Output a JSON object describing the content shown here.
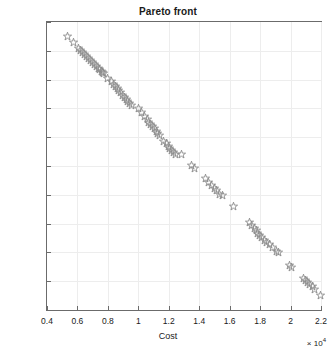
{
  "chart_data": {
    "type": "scatter",
    "title": "Pareto front",
    "xlabel": "Cost",
    "ylabel": "Quality",
    "x_exponent": "×10⁴",
    "x_exponent_mantissa": "× 10",
    "x_exponent_power": "4",
    "xlim": [
      0.4,
      2.2
    ],
    "ylim": [
      0,
      20
    ],
    "xticks": [
      0.4,
      0.6,
      0.8,
      1.0,
      1.2,
      1.4,
      1.6,
      1.8,
      2.0,
      2.2
    ],
    "xtick_labels": [
      "0.4",
      "0.6",
      "0.8",
      "1",
      "1.2",
      "1.4",
      "1.6",
      "1.8",
      "2",
      "2.2"
    ],
    "yticks": [
      0,
      2,
      4,
      6,
      8,
      10,
      12,
      14,
      16,
      18,
      20
    ],
    "ytick_labels": [
      "0",
      "2",
      "4",
      "6",
      "8",
      "10",
      "12",
      "14",
      "16",
      "18",
      "20"
    ],
    "grid": true,
    "legend": null,
    "marker": "pentagram-star-open",
    "marker_color": "#8a8a8a",
    "axis_color": "#6b6b6b",
    "grid_color": "#ededed",
    "title_color": "#1a1a1a",
    "series": [
      {
        "name": "Pareto front",
        "points": [
          [
            0.533,
            19.0
          ],
          [
            0.575,
            18.6
          ],
          [
            0.605,
            18.15
          ],
          [
            0.62,
            18.05
          ],
          [
            0.635,
            17.9
          ],
          [
            0.648,
            17.75
          ],
          [
            0.66,
            17.62
          ],
          [
            0.673,
            17.48
          ],
          [
            0.686,
            17.35
          ],
          [
            0.7,
            17.2
          ],
          [
            0.713,
            17.05
          ],
          [
            0.724,
            16.93
          ],
          [
            0.736,
            16.8
          ],
          [
            0.748,
            16.68
          ],
          [
            0.757,
            16.58
          ],
          [
            0.765,
            16.5
          ],
          [
            0.772,
            16.45
          ],
          [
            0.8,
            16.1
          ],
          [
            0.822,
            15.85
          ],
          [
            0.836,
            15.68
          ],
          [
            0.848,
            15.52
          ],
          [
            0.86,
            15.38
          ],
          [
            0.872,
            15.22
          ],
          [
            0.884,
            15.08
          ],
          [
            0.896,
            14.92
          ],
          [
            0.908,
            14.78
          ],
          [
            0.92,
            14.62
          ],
          [
            0.932,
            14.48
          ],
          [
            0.944,
            14.35
          ],
          [
            0.958,
            14.18
          ],
          [
            0.998,
            13.98
          ],
          [
            1.022,
            13.7
          ],
          [
            1.042,
            13.42
          ],
          [
            1.058,
            13.2
          ],
          [
            1.07,
            13.02
          ],
          [
            1.082,
            12.88
          ],
          [
            1.094,
            12.72
          ],
          [
            1.106,
            12.58
          ],
          [
            1.118,
            12.42
          ],
          [
            1.128,
            12.28
          ],
          [
            1.14,
            12.12
          ],
          [
            1.168,
            11.72
          ],
          [
            1.182,
            11.58
          ],
          [
            1.196,
            11.38
          ],
          [
            1.208,
            11.2
          ],
          [
            1.22,
            11.05
          ],
          [
            1.232,
            10.92
          ],
          [
            1.246,
            10.82
          ],
          [
            1.284,
            10.8
          ],
          [
            1.352,
            10.05
          ],
          [
            1.372,
            9.85
          ],
          [
            1.44,
            9.1
          ],
          [
            1.464,
            8.85
          ],
          [
            1.482,
            8.62
          ],
          [
            1.498,
            8.45
          ],
          [
            1.512,
            8.28
          ],
          [
            1.534,
            8.05
          ],
          [
            1.552,
            7.98
          ],
          [
            1.622,
            7.2
          ],
          [
            1.728,
            6.05
          ],
          [
            1.746,
            5.85
          ],
          [
            1.762,
            5.65
          ],
          [
            1.774,
            5.5
          ],
          [
            1.786,
            5.32
          ],
          [
            1.798,
            5.18
          ],
          [
            1.812,
            5.02
          ],
          [
            1.826,
            4.85
          ],
          [
            1.842,
            4.7
          ],
          [
            1.862,
            4.52
          ],
          [
            1.884,
            4.32
          ],
          [
            1.908,
            4.05
          ],
          [
            1.922,
            4.0
          ],
          [
            1.99,
            3.12
          ],
          [
            2.008,
            2.95
          ],
          [
            2.082,
            2.18
          ],
          [
            2.098,
            2.05
          ],
          [
            2.112,
            1.92
          ],
          [
            2.126,
            1.78
          ],
          [
            2.142,
            1.62
          ],
          [
            2.158,
            1.42
          ],
          [
            2.198,
            1.0
          ]
        ]
      }
    ]
  }
}
